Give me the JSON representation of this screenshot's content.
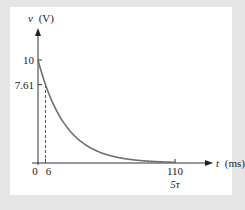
{
  "chart_data": {
    "type": "line",
    "title": "",
    "xlabel": "t (ms)",
    "ylabel": "v (V)",
    "x_axis_var": "t",
    "x_axis_unit": "(ms)",
    "y_axis_var": "v",
    "y_axis_unit": "(V)",
    "xlim": [
      0,
      125
    ],
    "ylim": [
      0,
      13
    ],
    "grid": false,
    "series": [
      {
        "name": "v(t)",
        "function": "10*exp(-t/22)",
        "V0": 10,
        "tau_ms": 22,
        "t_start": 0,
        "t_end": 110,
        "color": "#6f6f6f"
      }
    ],
    "x_ticks": [
      {
        "value": 0,
        "label": "0"
      },
      {
        "value": 6,
        "label": "6"
      },
      {
        "value": 110,
        "label": "110",
        "sublabel": "5τ"
      }
    ],
    "y_ticks": [
      {
        "value": 10,
        "label": "10"
      },
      {
        "value": 7.61,
        "label": "7.61"
      }
    ],
    "annotations": [
      {
        "type": "dashed-vertical",
        "x": 6,
        "from_y": 0,
        "to_y": 7.61
      }
    ]
  },
  "colors": {
    "background": "#e6e6e6",
    "panel": "#ffffff",
    "axis": "#333333",
    "curve": "#6f6f6f"
  }
}
